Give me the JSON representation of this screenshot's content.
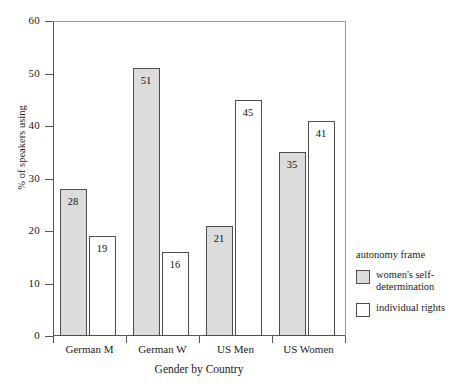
{
  "chart_data": {
    "type": "bar",
    "title": "",
    "xlabel": "Gender by Country",
    "ylabel": "% of speakers using",
    "categories": [
      "German M",
      "German W",
      "US Men",
      "US Women"
    ],
    "series": [
      {
        "name": "women's self-determination",
        "style": "filled",
        "values": [
          28,
          51,
          21,
          35
        ]
      },
      {
        "name": "individual rights",
        "style": "hollow",
        "values": [
          19,
          16,
          45,
          41
        ]
      }
    ],
    "ylim": [
      0,
      60
    ],
    "yticks": [
      0,
      10,
      20,
      30,
      40,
      50,
      60
    ],
    "ytick_labels": [
      "0",
      "10",
      "20",
      "30",
      "40",
      "50",
      "60"
    ],
    "grid": false,
    "legend_position": "right",
    "legend": {
      "title": "autonomy frame",
      "entries": [
        {
          "label": "women's self-determination",
          "style": "filled",
          "swatch_color": "#dcdcdc"
        },
        {
          "label": "individual rights",
          "style": "hollow",
          "swatch_color": "#ffffff"
        }
      ]
    },
    "colors": {
      "filled": "#dcdcdc",
      "hollow": "#ffffff",
      "bar_border": "#4d4d4d",
      "axis": "#555555",
      "background": "#ffffff"
    }
  }
}
